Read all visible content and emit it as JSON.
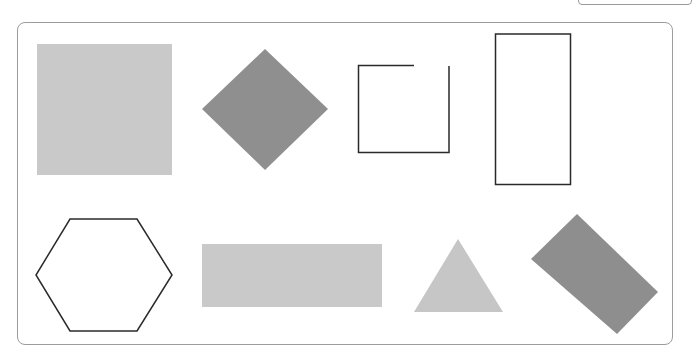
{
  "diagram": {
    "type": "shape-collection",
    "colors": {
      "light_fill": "#c8c8c8",
      "dark_fill": "#8e8e8e",
      "stroke": "#2a2a2a",
      "frame": "#9c9c9c"
    },
    "shapes": [
      {
        "id": "large-square",
        "kind": "square",
        "style": "filled-light"
      },
      {
        "id": "diamond",
        "kind": "rotated-square",
        "style": "filled-dark"
      },
      {
        "id": "open-square",
        "kind": "square-outline-with-gap",
        "style": "outline"
      },
      {
        "id": "tall-rectangle",
        "kind": "rectangle",
        "style": "outline"
      },
      {
        "id": "hexagon",
        "kind": "hexagon",
        "style": "outline"
      },
      {
        "id": "wide-rectangle",
        "kind": "rectangle",
        "style": "filled-light"
      },
      {
        "id": "triangle",
        "kind": "triangle",
        "style": "filled-light"
      },
      {
        "id": "tilted-rectangle",
        "kind": "rotated-rectangle",
        "style": "filled-dark"
      }
    ]
  }
}
